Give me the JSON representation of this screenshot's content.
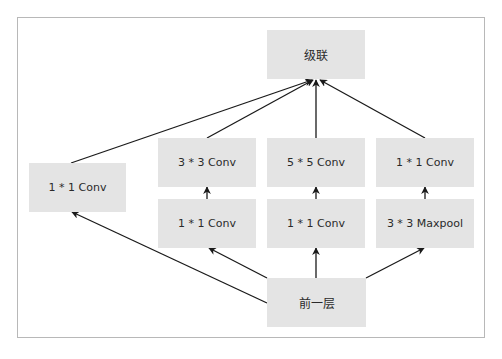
{
  "diagram": {
    "title": "",
    "type": "Inception module",
    "nodes": [
      {
        "id": "concat",
        "label": "级联",
        "x": 267,
        "y": 30,
        "w": 98,
        "h": 49
      },
      {
        "id": "conv1x1_a",
        "label": "1 * 1 Conv",
        "x": 29,
        "y": 163,
        "w": 97,
        "h": 49
      },
      {
        "id": "conv3x3",
        "label": "3 * 3 Conv",
        "x": 158,
        "y": 138,
        "w": 98,
        "h": 49
      },
      {
        "id": "conv5x5",
        "label": "5 * 5 Conv",
        "x": 267,
        "y": 138,
        "w": 98,
        "h": 49
      },
      {
        "id": "conv1x1_d",
        "label": "1 * 1 Conv",
        "x": 376,
        "y": 138,
        "w": 98,
        "h": 49
      },
      {
        "id": "conv1x1_b",
        "label": "1 * 1 Conv",
        "x": 158,
        "y": 199,
        "w": 98,
        "h": 49
      },
      {
        "id": "conv1x1_c",
        "label": "1 * 1 Conv",
        "x": 267,
        "y": 199,
        "w": 98,
        "h": 49
      },
      {
        "id": "maxpool",
        "label": "3 * 3 Maxpool",
        "x": 376,
        "y": 199,
        "w": 98,
        "h": 49
      },
      {
        "id": "prev",
        "label": "前一层",
        "x": 267,
        "y": 278,
        "w": 99,
        "h": 49
      }
    ],
    "edges": [
      {
        "from": "prev",
        "to": "conv1x1_a",
        "x1": 267,
        "y1": 303,
        "x2": 72,
        "y2": 212
      },
      {
        "from": "prev",
        "to": "conv1x1_b",
        "x1": 267,
        "y1": 278,
        "x2": 209,
        "y2": 248
      },
      {
        "from": "prev",
        "to": "conv1x1_c",
        "x1": 316,
        "y1": 278,
        "x2": 316,
        "y2": 248
      },
      {
        "from": "prev",
        "to": "maxpool",
        "x1": 366,
        "y1": 278,
        "x2": 424,
        "y2": 248
      },
      {
        "from": "conv1x1_b",
        "to": "conv3x3",
        "x1": 207,
        "y1": 199,
        "x2": 207,
        "y2": 187
      },
      {
        "from": "conv1x1_c",
        "to": "conv5x5",
        "x1": 316,
        "y1": 199,
        "x2": 316,
        "y2": 187
      },
      {
        "from": "maxpool",
        "to": "conv1x1_d",
        "x1": 425,
        "y1": 199,
        "x2": 425,
        "y2": 187
      },
      {
        "from": "conv1x1_a",
        "to": "concat",
        "x1": 71,
        "y1": 163,
        "x2": 312,
        "y2": 80
      },
      {
        "from": "conv3x3",
        "to": "concat",
        "x1": 207,
        "y1": 138,
        "x2": 313,
        "y2": 80
      },
      {
        "from": "conv5x5",
        "to": "concat",
        "x1": 316,
        "y1": 138,
        "x2": 316,
        "y2": 80
      },
      {
        "from": "conv1x1_d",
        "to": "concat",
        "x1": 425,
        "y1": 138,
        "x2": 320,
        "y2": 80
      }
    ]
  },
  "colors": {
    "node_fill": "#e4e4e4",
    "node_text": "#2a2a2a",
    "edge": "#1a1a1a",
    "frame": "#b8b8b8"
  }
}
